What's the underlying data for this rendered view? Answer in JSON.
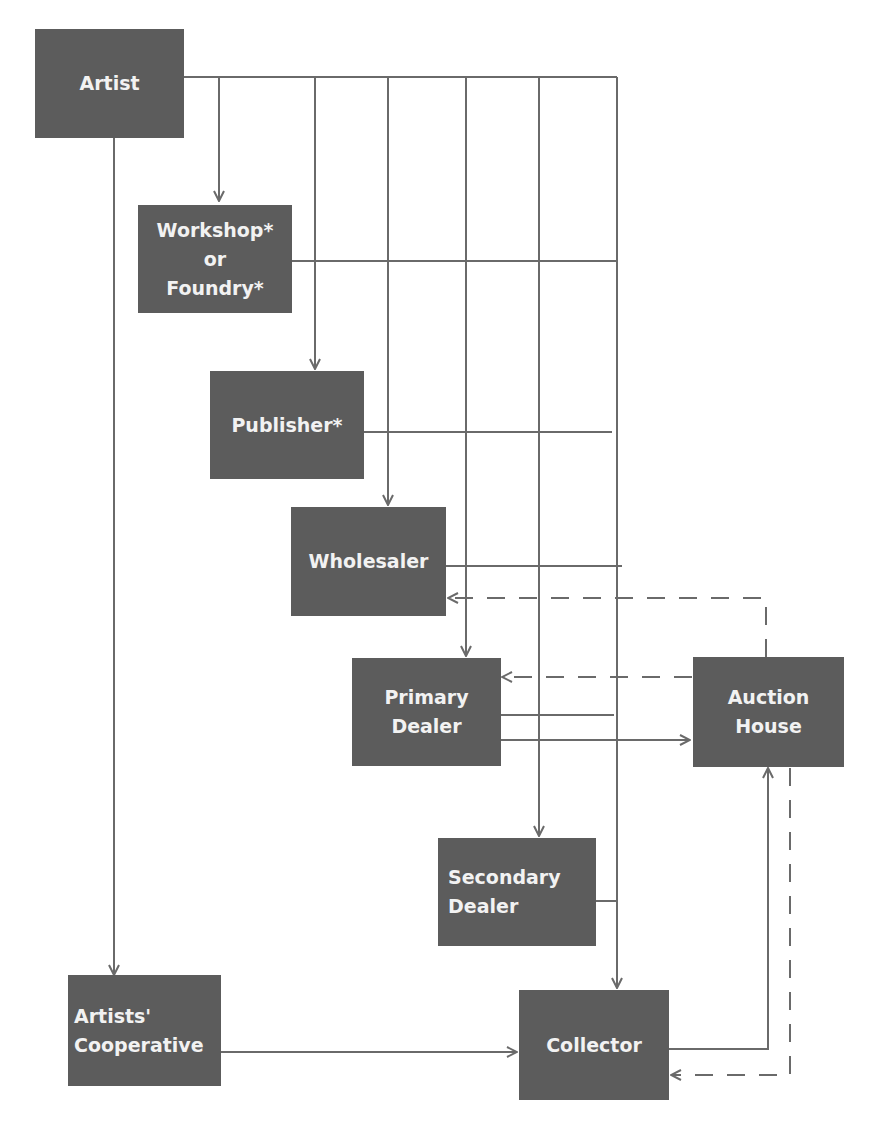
{
  "diagram": {
    "title": "",
    "colors": {
      "box": "#5c5c5c",
      "box_text": "#f2f2f2",
      "line": "#6a6a6a",
      "background": "#ffffff"
    },
    "nodes": [
      {
        "id": "artist",
        "label": "Artist"
      },
      {
        "id": "workshop",
        "label": "Workshop*\nor\nFoundry*"
      },
      {
        "id": "publisher",
        "label": "Publisher*"
      },
      {
        "id": "wholesaler",
        "label": "Wholesaler"
      },
      {
        "id": "primary_dealer",
        "label": "Primary\nDealer"
      },
      {
        "id": "auction_house",
        "label": "Auction\nHouse"
      },
      {
        "id": "secondary_dealer",
        "label": "Secondary\nDealer"
      },
      {
        "id": "artists_cooperative",
        "label": "Artists'\nCooperative"
      },
      {
        "id": "collector",
        "label": "Collector"
      }
    ],
    "edges": [
      {
        "from": "artist",
        "to": "workshop",
        "style": "solid"
      },
      {
        "from": "artist",
        "to": "publisher",
        "style": "solid"
      },
      {
        "from": "artist",
        "to": "wholesaler",
        "style": "solid"
      },
      {
        "from": "artist",
        "to": "primary_dealer",
        "style": "solid"
      },
      {
        "from": "artist",
        "to": "secondary_dealer",
        "style": "solid"
      },
      {
        "from": "artist",
        "to": "collector",
        "style": "solid"
      },
      {
        "from": "artist",
        "to": "artists_cooperative",
        "style": "solid"
      },
      {
        "from": "workshop",
        "to": "collector",
        "style": "solid"
      },
      {
        "from": "publisher",
        "to": "collector",
        "style": "solid"
      },
      {
        "from": "wholesaler",
        "to": "collector",
        "style": "solid"
      },
      {
        "from": "primary_dealer",
        "to": "collector",
        "style": "solid"
      },
      {
        "from": "primary_dealer",
        "to": "auction_house",
        "style": "solid"
      },
      {
        "from": "secondary_dealer",
        "to": "collector",
        "style": "solid"
      },
      {
        "from": "artists_cooperative",
        "to": "collector",
        "style": "solid"
      },
      {
        "from": "collector",
        "to": "auction_house",
        "style": "solid"
      },
      {
        "from": "auction_house",
        "to": "wholesaler",
        "style": "dashed"
      },
      {
        "from": "auction_house",
        "to": "primary_dealer",
        "style": "dashed"
      },
      {
        "from": "auction_house",
        "to": "collector",
        "style": "dashed"
      }
    ],
    "notes": {
      "asterisk": "*"
    }
  }
}
